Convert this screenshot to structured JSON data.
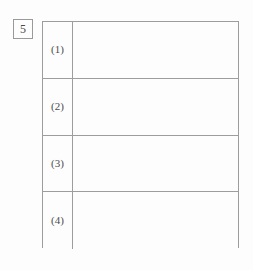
{
  "page": {
    "background_color": "#fdfdfd",
    "line_color": "#9d9d9d",
    "text_color": "#4c4c4c"
  },
  "question": {
    "number": "5"
  },
  "answer_table": {
    "rows": [
      {
        "label": "(1)",
        "answer": ""
      },
      {
        "label": "(2)",
        "answer": ""
      },
      {
        "label": "(3)",
        "answer": ""
      },
      {
        "label": "(4)",
        "answer": ""
      }
    ]
  }
}
